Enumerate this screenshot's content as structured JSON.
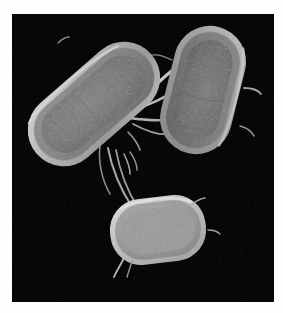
{
  "figure": {
    "kind": "sem-micrograph",
    "caption": "",
    "background_color": "#000000",
    "paper_color": "#fefefe",
    "plate": {
      "x": 12,
      "y": 14,
      "width": 262,
      "height": 288
    }
  },
  "palette": {
    "background": "#000000",
    "cell_rim_bright": "#c9c9c9",
    "cell_body_mid": "#8e8e8e",
    "cell_body_dark": "#6a6a6a",
    "cell_core": "#7c7c7c",
    "filament": "#b4b4b4",
    "filament_dim": "#8a8a8a",
    "paper": "#fefefe"
  },
  "chart_data": {
    "type": "scatter",
    "title": "",
    "xlabel": "",
    "ylabel": "",
    "grid": false,
    "legend_position": "none",
    "xlim": [
      0,
      262
    ],
    "ylim": [
      0,
      288
    ],
    "cells": [
      {
        "id": "cell-upper-left",
        "label": "rod-shaped bacterium (upper left)",
        "shape": "rod",
        "cx": 82,
        "cy": 90,
        "length": 150,
        "width": 70,
        "rotation_deg": -41,
        "brightness": "medium",
        "rim_color": "#bdbdbd",
        "body_color": "#878787",
        "core_color": "#787878"
      },
      {
        "id": "cell-upper-right",
        "label": "rod-shaped bacterium (upper right)",
        "shape": "rod",
        "cx": 191,
        "cy": 75,
        "length": 128,
        "width": 70,
        "rotation_deg": 14,
        "brightness": "medium-dark",
        "rim_color": "#b0b0b0",
        "body_color": "#7e7e7e",
        "core_color": "#6f6f6f"
      },
      {
        "id": "cell-lower",
        "label": "short oval bacterium (bottom)",
        "shape": "ovoid",
        "cx": 146,
        "cy": 215,
        "length": 92,
        "width": 64,
        "rotation_deg": -7,
        "brightness": "bright",
        "rim_color": "#cecece",
        "body_color": "#9d9d9d",
        "core_color": "#9a9a9a"
      }
    ],
    "filaments": [
      {
        "id": "bridge-upper-pair",
        "from": "cell-upper-left",
        "to": "cell-upper-right",
        "thickness": 3.0,
        "brightness": "bright"
      },
      {
        "id": "bridge-upper-pair-lower",
        "from": "cell-upper-left",
        "to": "cell-upper-right",
        "thickness": 2.4,
        "brightness": "bright"
      },
      {
        "id": "strand-left-to-lower-a",
        "from": "cell-upper-left",
        "to": "cell-lower",
        "thickness": 1.8,
        "brightness": "medium"
      },
      {
        "id": "strand-left-to-lower-b",
        "from": "cell-upper-left",
        "to": "cell-lower",
        "thickness": 1.6,
        "brightness": "medium"
      },
      {
        "id": "pilus-left-tip",
        "from": "cell-upper-left",
        "to": "free-end",
        "thickness": 1.5,
        "brightness": "medium"
      },
      {
        "id": "pilus-right-side",
        "from": "cell-upper-right",
        "to": "free-end",
        "thickness": 1.6,
        "brightness": "medium"
      },
      {
        "id": "flagellum-lower-cell",
        "from": "cell-lower",
        "to": "free-end",
        "thickness": 1.6,
        "brightness": "medium"
      }
    ]
  }
}
